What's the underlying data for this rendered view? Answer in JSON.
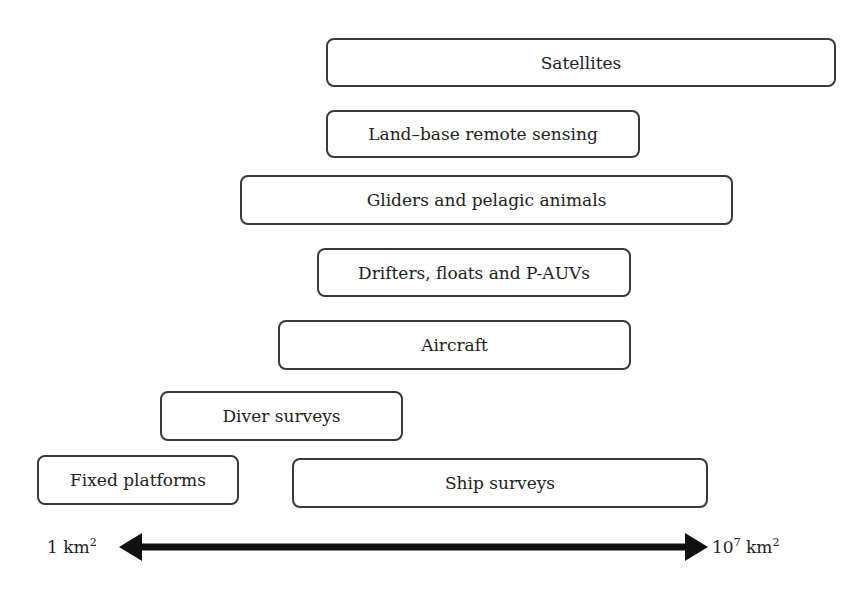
{
  "diagram": {
    "type": "scale-range",
    "boxes": [
      {
        "label": "Satellites",
        "left": 326,
        "top": 38,
        "width": 510,
        "height": 49
      },
      {
        "label": "Land–base remote sensing",
        "left": 326,
        "top": 110,
        "width": 314,
        "height": 48
      },
      {
        "label": "Gliders and pelagic animals",
        "left": 240,
        "top": 175,
        "width": 493,
        "height": 50
      },
      {
        "label": "Drifters, floats and P-AUVs",
        "left": 317,
        "top": 248,
        "width": 314,
        "height": 49
      },
      {
        "label": "Aircraft",
        "left": 278,
        "top": 320,
        "width": 353,
        "height": 50
      },
      {
        "label": "Diver surveys",
        "left": 160,
        "top": 391,
        "width": 243,
        "height": 50
      },
      {
        "label": "Fixed platforms",
        "left": 37,
        "top": 455,
        "width": 202,
        "height": 50
      },
      {
        "label": "Ship surveys",
        "left": 292,
        "top": 458,
        "width": 416,
        "height": 50
      }
    ],
    "axis": {
      "min_label": "1 km",
      "min_sup": "2",
      "max_label": "10",
      "max_sup1": "7",
      "max_unit": " km",
      "max_sup2": "2",
      "arrow_color": "#111111"
    }
  }
}
